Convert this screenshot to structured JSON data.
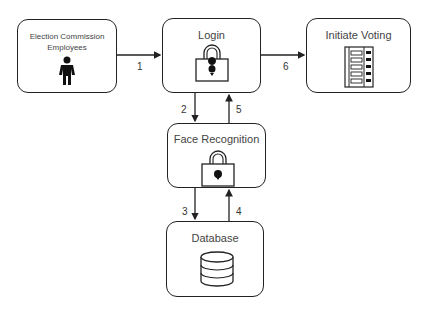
{
  "nodes": {
    "employees": {
      "label": "Election Commission Employees",
      "line1": "Election Commission",
      "line2": "Employees",
      "icon": "person-icon"
    },
    "login": {
      "label": "Login",
      "icon": "padlock-icon"
    },
    "initiate_voting": {
      "label": "Initiate Voting",
      "icon": "voting-machine-icon"
    },
    "face_recognition": {
      "label": "Face Recognition",
      "icon": "padlock-icon"
    },
    "database": {
      "label": "Database",
      "icon": "database-icon"
    }
  },
  "edges": [
    {
      "from": "employees",
      "to": "login",
      "label": "1"
    },
    {
      "from": "login",
      "to": "face_recognition",
      "label": "2"
    },
    {
      "from": "face_recognition",
      "to": "database",
      "label": "3"
    },
    {
      "from": "database",
      "to": "face_recognition",
      "label": "4"
    },
    {
      "from": "face_recognition",
      "to": "login",
      "label": "5"
    },
    {
      "from": "login",
      "to": "initiate_voting",
      "label": "6"
    }
  ]
}
